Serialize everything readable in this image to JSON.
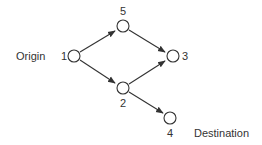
{
  "diagram": {
    "type": "directed-network",
    "origin_label": "Origin",
    "destination_label": "Destination",
    "nodes": [
      {
        "id": "1",
        "label": "1",
        "cx": 74,
        "cy": 56
      },
      {
        "id": "5",
        "label": "5",
        "cx": 123,
        "cy": 26
      },
      {
        "id": "3",
        "label": "3",
        "cx": 173,
        "cy": 56
      },
      {
        "id": "2",
        "label": "2",
        "cx": 123,
        "cy": 88
      },
      {
        "id": "4",
        "label": "4",
        "cx": 170,
        "cy": 118
      }
    ],
    "edges": [
      {
        "from": "1",
        "to": "5"
      },
      {
        "from": "1",
        "to": "2"
      },
      {
        "from": "5",
        "to": "3"
      },
      {
        "from": "2",
        "to": "3"
      },
      {
        "from": "2",
        "to": "4"
      }
    ],
    "colors": {
      "stroke": "#333333",
      "background": "#ffffff"
    }
  }
}
